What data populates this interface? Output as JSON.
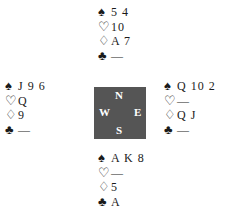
{
  "hands": {
    "north": {
      "spades": "5 4",
      "hearts": "10",
      "diamonds": "A 7",
      "clubs": "—"
    },
    "west": {
      "spades": "J 9 6",
      "hearts": "Q",
      "diamonds": "9",
      "clubs": "—"
    },
    "east": {
      "spades": "Q 10 2",
      "hearts": "—",
      "diamonds": "Q J",
      "clubs": "—"
    },
    "south": {
      "spades": "A K 8",
      "hearts": "—",
      "diamonds": "5",
      "clubs": "A"
    }
  },
  "suits": {
    "spades": "♠",
    "hearts": "♡",
    "diamonds": "♢",
    "clubs": "♣"
  },
  "compass": {
    "north": "N",
    "south": "S",
    "west": "W",
    "east": "E",
    "background": "#555555"
  }
}
